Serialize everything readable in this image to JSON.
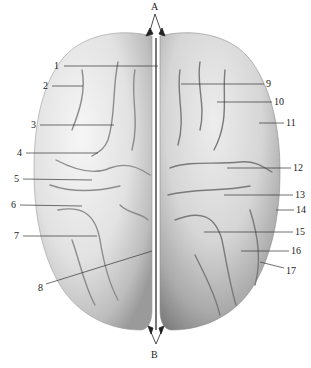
{
  "figure": {
    "orientation_labels": {
      "top": "A",
      "bottom": "B"
    },
    "left_labels": [
      {
        "text": "1",
        "x": 58,
        "y": 66,
        "tx": 158,
        "ty": 66
      },
      {
        "text": "2",
        "x": 46,
        "y": 86,
        "tx": 83,
        "ty": 86
      },
      {
        "text": "3",
        "x": 34,
        "y": 125,
        "tx": 114,
        "ty": 125
      },
      {
        "text": "4",
        "x": 20,
        "y": 153,
        "tx": 98,
        "ty": 153
      },
      {
        "text": "5",
        "x": 17,
        "y": 179,
        "tx": 92,
        "ty": 180
      },
      {
        "text": "6",
        "x": 14,
        "y": 205,
        "tx": 82,
        "ty": 206
      },
      {
        "text": "7",
        "x": 17,
        "y": 236,
        "tx": 97,
        "ty": 236
      },
      {
        "text": "8",
        "x": 40,
        "y": 287,
        "tx": 152,
        "ty": 251
      }
    ],
    "right_labels": [
      {
        "text": "9",
        "x": 267,
        "y": 83,
        "tx": 181,
        "ty": 84
      },
      {
        "text": "10",
        "x": 275,
        "y": 101,
        "tx": 217,
        "ty": 102
      },
      {
        "text": "11",
        "x": 287,
        "y": 122,
        "tx": 259,
        "ty": 123
      },
      {
        "text": "12",
        "x": 294,
        "y": 168,
        "tx": 227,
        "ty": 168
      },
      {
        "text": "13",
        "x": 296,
        "y": 194,
        "tx": 224,
        "ty": 195
      },
      {
        "text": "14",
        "x": 297,
        "y": 210,
        "tx": 276,
        "ty": 210
      },
      {
        "text": "15",
        "x": 296,
        "y": 232,
        "tx": 204,
        "ty": 232
      },
      {
        "text": "16",
        "x": 292,
        "y": 251,
        "tx": 241,
        "ty": 251
      },
      {
        "text": "17",
        "x": 287,
        "y": 270,
        "tx": 260,
        "ty": 262
      }
    ],
    "colors": {
      "background": "#ffffff",
      "brain_light": "#eeeeee",
      "brain_mid": "#c8c8c8",
      "brain_dark": "#8a8a8a",
      "leader_line": "#333333",
      "text": "#222222"
    }
  }
}
